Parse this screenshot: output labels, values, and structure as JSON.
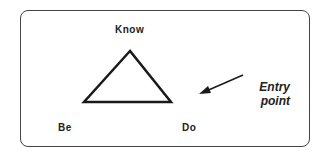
{
  "diagram": {
    "labels": {
      "know": "Know",
      "be": "Be",
      "do": "Do"
    },
    "annotation": {
      "line1": "Entry",
      "line2": "point"
    },
    "colors": {
      "stroke": "#1a1a1a",
      "frame": "#444444",
      "background": "#ffffff"
    }
  }
}
